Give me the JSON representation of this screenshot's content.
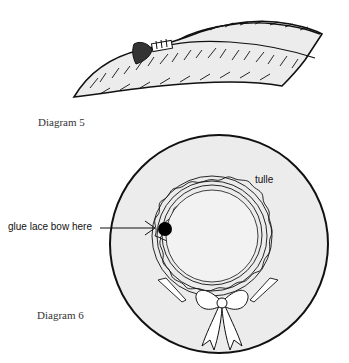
{
  "diagram5": {
    "caption": "Diagram 5",
    "fill_color": "#ececec",
    "stroke_color": "#111111"
  },
  "diagram6": {
    "caption": "Diagram 6",
    "labels": {
      "tulle": "tulle",
      "glue_point": "glue lace bow here"
    },
    "fill_color": "#ececec",
    "stroke_color": "#111111"
  }
}
